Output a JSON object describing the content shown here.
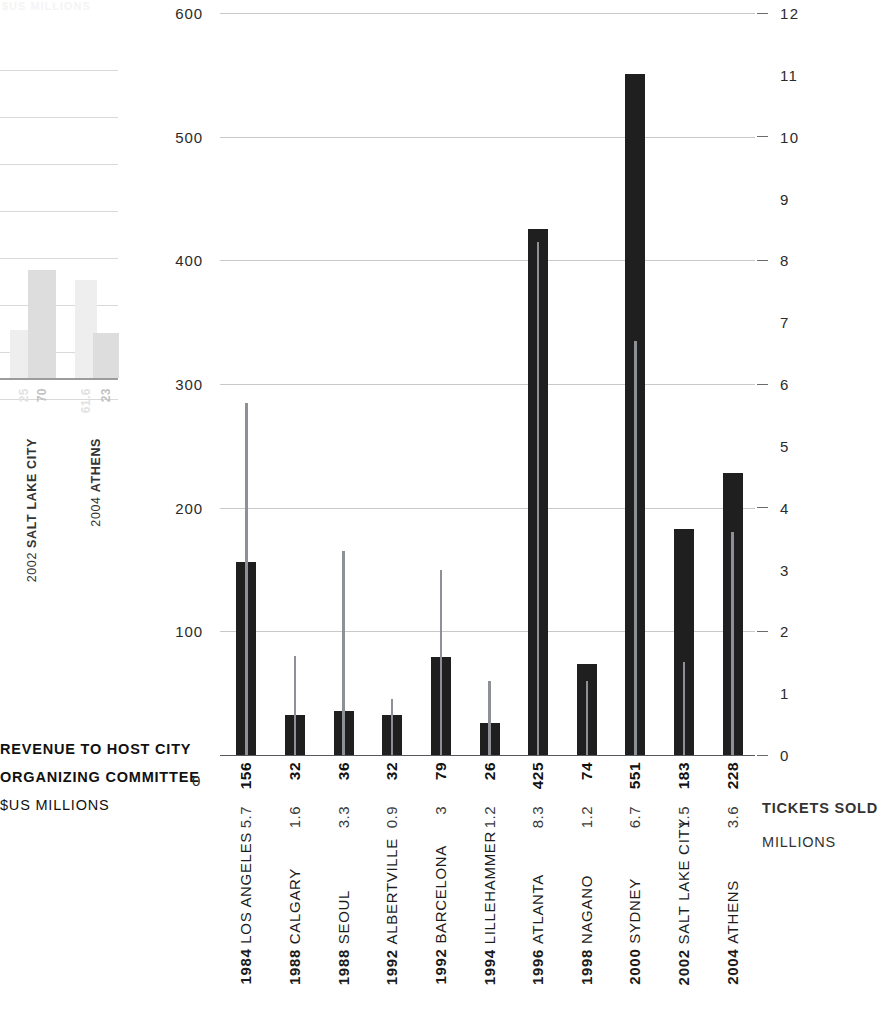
{
  "chart_data": {
    "type": "bar",
    "title": "",
    "categories": [
      "1984 LOS ANGELES",
      "1988 CALGARY",
      "1988 SEOUL",
      "1992 ALBERTVILLE",
      "1992 BARCELONA",
      "1994 LILLEHAMMER",
      "1996 ATLANTA",
      "1998 NAGANO",
      "2000 SYDNEY",
      "2002 SALT LAKE CITY",
      "2004 ATHENS"
    ],
    "category_years": [
      "1984",
      "1988",
      "1988",
      "1992",
      "1992",
      "1994",
      "1996",
      "1998",
      "2000",
      "2002",
      "2004"
    ],
    "category_cities": [
      "LOS ANGELES",
      "CALGARY",
      "SEOUL",
      "ALBERTVILLE",
      "BARCELONA",
      "LILLEHAMMER",
      "ATLANTA",
      "NAGANO",
      "SYDNEY",
      "SALT LAKE CITY",
      "ATHENS"
    ],
    "series": [
      {
        "name": "REVENUE TO HOST CITY ORGANIZING COMMITTEE",
        "unit": "$US MILLIONS",
        "axis": "left",
        "render": "bar",
        "color": "#1f1f1f",
        "values": [
          156,
          32,
          36,
          32,
          79,
          26,
          425,
          74,
          551,
          183,
          228
        ],
        "labels": [
          "156",
          "32",
          "36",
          "32",
          "79",
          "26",
          "425",
          "74",
          "551",
          "183",
          "228"
        ]
      },
      {
        "name": "TICKETS SOLD",
        "unit": "MILLIONS",
        "axis": "right",
        "render": "line-marker",
        "color": "#8d9095",
        "values": [
          5.7,
          1.6,
          3.3,
          0.9,
          3,
          1.2,
          8.3,
          1.2,
          6.7,
          1.5,
          3.6
        ],
        "labels": [
          "5.7",
          "1.6",
          "3.3",
          "0.9",
          "3",
          "1.2",
          "8.3",
          "1.2",
          "6.7",
          "1.5",
          "3.6"
        ]
      }
    ],
    "left_axis": {
      "label_lines": [
        "REVENUE TO HOST CITY",
        "ORGANIZING COMMITTEE",
        "$US MILLIONS"
      ],
      "zero_label": "0",
      "ylim": [
        0,
        600
      ],
      "ticks": [
        100,
        200,
        300,
        400,
        500,
        600
      ],
      "tick_labels": [
        "100",
        "200",
        "300",
        "400",
        "500",
        "600"
      ],
      "gridlines": true
    },
    "right_axis": {
      "label_lines": [
        "TICKETS SOLD",
        "MILLIONS"
      ],
      "ylim": [
        0,
        12
      ],
      "ticks": [
        0,
        1,
        2,
        3,
        4,
        5,
        6,
        7,
        8,
        9,
        10,
        11,
        12
      ],
      "tick_labels": [
        "0",
        "1",
        "2",
        "3",
        "4",
        "5",
        "6",
        "7",
        "8",
        "9",
        "10",
        "11",
        "12"
      ],
      "gridline_ticks": [
        0,
        2,
        4,
        6,
        8,
        10,
        12
      ]
    },
    "grid": true,
    "legend_position": "none"
  },
  "ghost_chart": {
    "title": "$US MILLIONS",
    "groups": [
      {
        "year": "2002",
        "city": "SALT LAKE CITY",
        "bars": [
          {
            "label": "25",
            "value": 25,
            "faded": true
          },
          {
            "label": "70",
            "value": 70,
            "faded": false
          }
        ]
      },
      {
        "year": "2004",
        "city": "ATHENS",
        "bars": [
          {
            "label": "61.6",
            "value": 61.6,
            "faded": true
          },
          {
            "label": "23",
            "value": 23,
            "faded": false
          }
        ]
      }
    ]
  }
}
